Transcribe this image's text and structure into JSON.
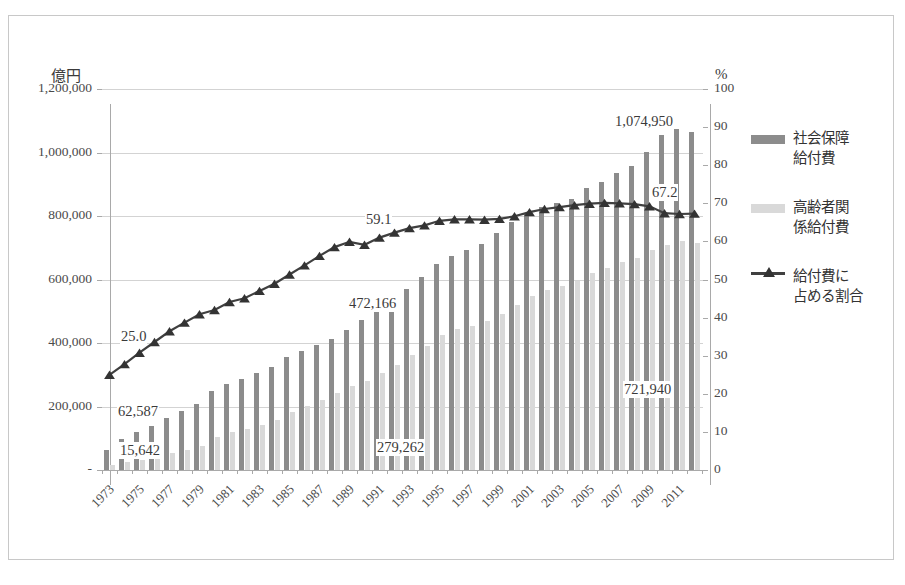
{
  "axes": {
    "left_unit": "億円",
    "right_unit": "%",
    "left_ticks": [
      "1,200,000",
      "1,000,000",
      "800,000",
      "600,000",
      "400,000",
      "200,000",
      "-"
    ],
    "right_ticks": [
      "100",
      "90",
      "80",
      "70",
      "60",
      "50",
      "40",
      "30",
      "20",
      "10",
      "0"
    ]
  },
  "legend": {
    "items": [
      {
        "label_line1": "社会保障",
        "label_line2": "給付費",
        "type": "bar",
        "color": "#8c8c8c"
      },
      {
        "label_line1": "高齢者関",
        "label_line2": "係給付費",
        "type": "bar",
        "color": "#d9d9d9"
      },
      {
        "label_line1": "給付費に",
        "label_line2": "占める割合",
        "type": "line",
        "color": "#404040"
      }
    ]
  },
  "annotations": [
    {
      "text": "62,587",
      "x": 116,
      "y": 402
    },
    {
      "text": "15,642",
      "x": 118,
      "y": 441
    },
    {
      "text": "472,166",
      "x": 347,
      "y": 294
    },
    {
      "text": "279,262",
      "x": 375,
      "y": 438
    },
    {
      "text": "1,074,950",
      "x": 613,
      "y": 112
    },
    {
      "text": "721,940",
      "x": 622,
      "y": 380
    },
    {
      "text": "25.0",
      "x": 119,
      "y": 327
    },
    {
      "text": "59.1",
      "x": 364,
      "y": 210
    },
    {
      "text": "67.2",
      "x": 650,
      "y": 183
    }
  ],
  "chart_data": {
    "type": "bar",
    "title": "",
    "xlabel": "",
    "ylabel": "億円",
    "y2label": "%",
    "ylim": [
      0,
      1200000
    ],
    "y2lim": [
      0,
      100
    ],
    "grid": true,
    "legend_position": "right",
    "x": [
      1973,
      1974,
      1975,
      1976,
      1977,
      1978,
      1979,
      1980,
      1981,
      1982,
      1983,
      1984,
      1985,
      1986,
      1987,
      1988,
      1989,
      1990,
      1991,
      1992,
      1993,
      1994,
      1995,
      1996,
      1997,
      1998,
      1999,
      2000,
      2001,
      2002,
      2003,
      2004,
      2005,
      2006,
      2007,
      2008,
      2009,
      2010,
      2011,
      2012
    ],
    "xtick_labels": [
      "1973",
      "",
      "1975",
      "",
      "1977",
      "",
      "1979",
      "",
      "1981",
      "",
      "1983",
      "",
      "1985",
      "",
      "1987",
      "",
      "1989",
      "",
      "1991",
      "",
      "1993",
      "",
      "1995",
      "",
      "1997",
      "",
      "1999",
      "",
      "2001",
      "",
      "2003",
      "",
      "2005",
      "",
      "2007",
      "",
      "2009",
      "",
      "2011",
      ""
    ],
    "series": [
      {
        "name": "社会保障給付費",
        "color": "#8c8c8c",
        "values": [
          62587,
          96392,
          118192,
          139539,
          164000,
          187000,
          208000,
          247736,
          270000,
          288000,
          304000,
          323000,
          356798,
          376000,
          395000,
          414000,
          442000,
          472166,
          500000,
          530000,
          570000,
          608000,
          649842,
          673000,
          692000,
          712000,
          746000,
          781191,
          809000,
          829000,
          840000,
          855000,
          888377,
          906000,
          936000,
          958441,
          1003000,
          1053660,
          1074950,
          1063000
        ]
      },
      {
        "name": "高齢者関係給付費",
        "color": "#d9d9d9",
        "values": [
          15642,
          24000,
          33000,
          42000,
          52000,
          64000,
          77000,
          104000,
          119000,
          130000,
          143000,
          158000,
          183000,
          202000,
          222000,
          242000,
          265000,
          279262,
          305000,
          330000,
          362000,
          390000,
          425000,
          443000,
          455000,
          468000,
          492000,
          520000,
          548000,
          568000,
          580000,
          594000,
          621000,
          635000,
          655000,
          669000,
          694000,
          710000,
          721940,
          715000
        ]
      },
      {
        "name": "給付費に占める割合",
        "axis": "right",
        "color": "#404040",
        "marker": "triangle",
        "values": [
          25.0,
          27.8,
          30.8,
          33.6,
          36.4,
          38.7,
          40.9,
          42.0,
          44.1,
          45.1,
          47.0,
          48.9,
          51.3,
          53.7,
          56.2,
          58.5,
          59.9,
          59.1,
          61.0,
          62.3,
          63.5,
          64.2,
          65.4,
          65.8,
          65.8,
          65.7,
          65.9,
          66.6,
          67.7,
          68.5,
          69.0,
          69.5,
          69.9,
          70.1,
          70.0,
          69.8,
          69.2,
          67.4,
          67.2,
          67.3
        ]
      }
    ]
  }
}
